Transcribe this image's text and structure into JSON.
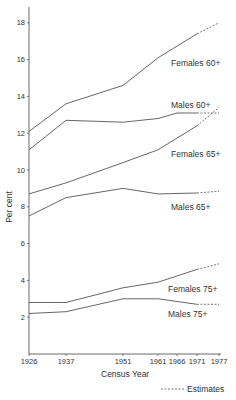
{
  "chart_data": {
    "type": "line",
    "title": "",
    "xlabel": "Census Year",
    "ylabel": "Per cent",
    "x": [
      1926,
      1937,
      1951,
      1961,
      1966,
      1971,
      1977
    ],
    "x_tick_labels": [
      "1926",
      "1937",
      "1951",
      "1961",
      "1966",
      "1971",
      "1977"
    ],
    "y_ticks": [
      2,
      4,
      6,
      8,
      10,
      12,
      14,
      16,
      18
    ],
    "ylim": [
      0,
      19
    ],
    "grid": false,
    "estimate_from": 1971,
    "legend": {
      "position": "bottom-right",
      "entries": [
        {
          "style": "dashed",
          "label": "Estimates"
        }
      ]
    },
    "series": [
      {
        "name": "Females 60+",
        "x": [
          1926,
          1937,
          1951,
          1961,
          1971,
          1977
        ],
        "values": [
          12.1,
          13.6,
          14.6,
          16.1,
          17.4,
          18.0
        ]
      },
      {
        "name": "Males 60+",
        "x": [
          1926,
          1937,
          1951,
          1961,
          1966,
          1971,
          1977
        ],
        "values": [
          11.1,
          12.7,
          12.6,
          12.8,
          13.1,
          13.1,
          13.1
        ]
      },
      {
        "name": "Females 65+",
        "x": [
          1926,
          1937,
          1951,
          1961,
          1971,
          1977
        ],
        "values": [
          8.7,
          9.3,
          10.4,
          11.1,
          12.4,
          13.4
        ]
      },
      {
        "name": "Males 65+",
        "x": [
          1926,
          1937,
          1951,
          1961,
          1971,
          1977
        ],
        "values": [
          7.5,
          8.5,
          9.0,
          8.7,
          8.75,
          8.85
        ]
      },
      {
        "name": "Females 75+",
        "x": [
          1926,
          1937,
          1951,
          1961,
          1971,
          1977
        ],
        "values": [
          2.8,
          2.8,
          3.6,
          3.9,
          4.6,
          4.9
        ]
      },
      {
        "name": "Males 75+",
        "x": [
          1926,
          1937,
          1951,
          1961,
          1971,
          1977
        ],
        "values": [
          2.2,
          2.3,
          3.0,
          3.0,
          2.7,
          2.7
        ]
      }
    ]
  },
  "labels": {
    "females_60": "Females 60+",
    "males_60": "Males 60+",
    "females_65": "Females 65+",
    "males_65": "Males 65+",
    "females_75": "Females 75+",
    "males_75": "Males 75+",
    "ylabel": "Per cent",
    "xlabel": "Census Year",
    "legend_estimates": "Estimates"
  },
  "colors": {
    "line": "#555555",
    "axis": "#444444",
    "text": "#333333"
  }
}
